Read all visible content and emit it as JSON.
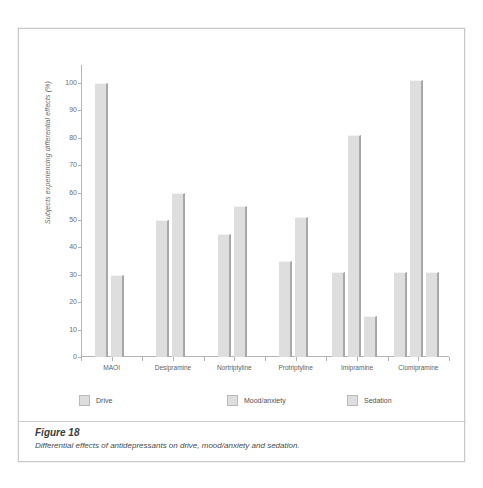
{
  "figure": {
    "caption_title": "Figure 18",
    "caption_text": "Differential effects of antidepressants on drive, mood/anxiety and sedation."
  },
  "chart_data": {
    "type": "bar",
    "title": "",
    "subtitle": "",
    "xlabel": "",
    "ylabel": "Subjects experiencing differential effects (%)",
    "ylim": [
      0,
      100
    ],
    "yticks": [
      0,
      10,
      20,
      30,
      40,
      50,
      60,
      70,
      80,
      90,
      100
    ],
    "grid": false,
    "legend_position": "bottom",
    "categories": [
      "MAOI",
      "Desipramine",
      "Nortriptyline",
      "Protriptyline",
      "Imipramine",
      "Clomipramine"
    ],
    "series": [
      {
        "name": "Drive",
        "values": [
          100,
          50,
          45,
          35,
          31,
          31
        ]
      },
      {
        "name": "Mood/anxiety",
        "values": [
          30,
          60,
          55,
          51,
          81,
          101
        ]
      },
      {
        "name": "Sedation",
        "values": [
          null,
          null,
          null,
          null,
          15,
          31
        ]
      }
    ],
    "bar_fill_color": "#dedede",
    "bar_edge_color": "#a8a8a8",
    "axis_color": "#b4b4b4",
    "text_color": "#6d6d6d"
  }
}
